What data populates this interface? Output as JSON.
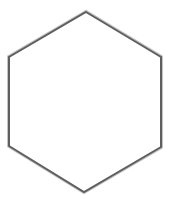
{
  "figure": {
    "caption_fragment": "",
    "shape": "hexagon",
    "vertices": [
      [
        86,
        12
      ],
      [
        161,
        57
      ],
      [
        161,
        147
      ],
      [
        84,
        192
      ],
      [
        9,
        146
      ],
      [
        9,
        57
      ]
    ],
    "stroke_color": "#5f5f5f",
    "stroke_outline_color": "#bdbdbd",
    "fill_color": "#ffffff"
  }
}
